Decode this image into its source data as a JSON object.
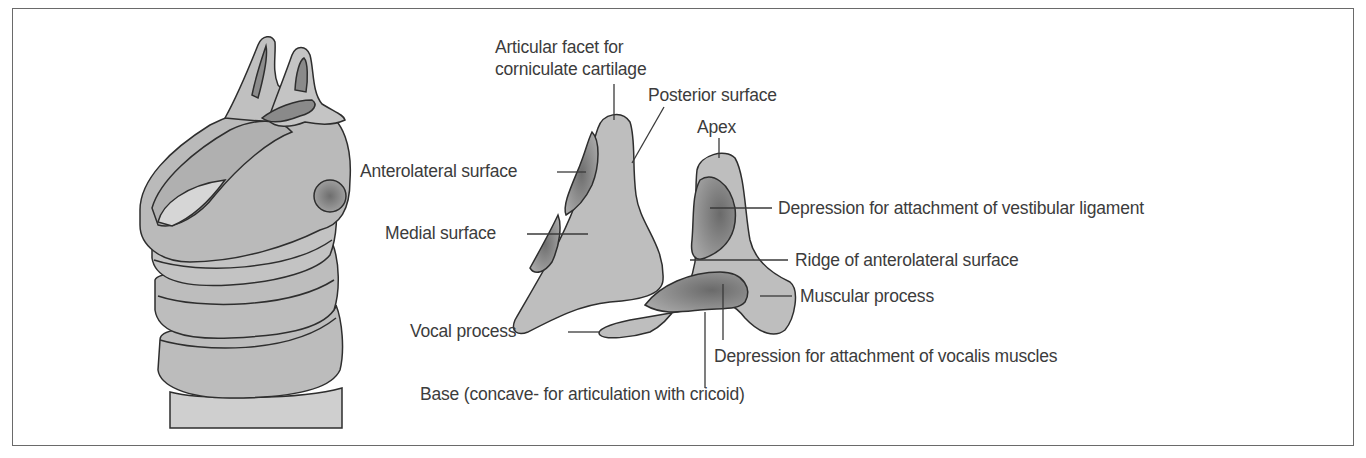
{
  "figure": {
    "panels": [
      {
        "id": "larynx-overview",
        "description": "Larynx with arytenoid cartilages viewed from posterolateral side"
      },
      {
        "id": "arytenoid-medial-view",
        "description": "Arytenoid cartilage, medial view"
      },
      {
        "id": "arytenoid-anterolateral-view",
        "description": "Arytenoid cartilage, anterolateral view"
      }
    ],
    "colors": {
      "cartilage_fill": "#bdbdbd",
      "cartilage_light": "#d0d0d0",
      "depression_fill": "#7a7a7a",
      "outline": "#2e2e2e",
      "frame": "#6a6a6a",
      "text": "#3c3c3c"
    }
  },
  "labels": {
    "articular_facet_line1": "Articular facet for",
    "articular_facet_line2": "corniculate cartilage",
    "posterior_surface": "Posterior surface",
    "apex": "Apex",
    "anterolateral_surface": "Anterolateral surface",
    "medial_surface": "Medial surface",
    "depression_vestibular": "Depression for attachment of vestibular ligament",
    "ridge_anterolateral": "Ridge of anterolateral surface",
    "muscular_process": "Muscular process",
    "vocal_process": "Vocal process",
    "depression_vocalis": "Depression for attachment of vocalis muscles",
    "base": "Base (concave- for articulation with cricoid)"
  }
}
